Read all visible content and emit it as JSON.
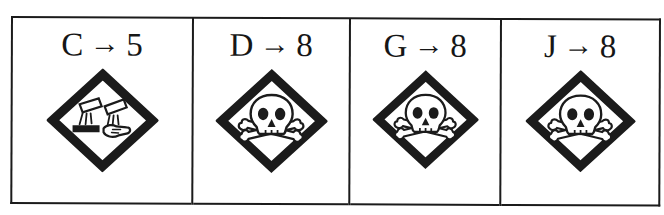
{
  "document": {
    "type": "scanned-answer-table",
    "background_color": "#ffffff",
    "ink_color": "#1b1b1b",
    "border_width_px": 2
  },
  "table": {
    "columns": 4,
    "rows": 1,
    "cells": [
      {
        "source_letter": "C",
        "arrow": "→",
        "target_number": "5",
        "mapping_text": "C → 5",
        "pictogram": "corrosion-hazard-icon",
        "pictogram_label": "GHS05 corrosion",
        "pictogram_description": "diamond outline containing two tilted test tubes pouring liquid onto a flat surface and a hand"
      },
      {
        "source_letter": "D",
        "arrow": "→",
        "target_number": "8",
        "mapping_text": "D → 8",
        "pictogram": "skull-and-crossbones-icon",
        "pictogram_label": "GHS06 acute toxicity",
        "pictogram_description": "diamond outline containing a skull above crossed bones"
      },
      {
        "source_letter": "G",
        "arrow": "→",
        "target_number": "8",
        "mapping_text": "G → 8",
        "pictogram": "skull-and-crossbones-icon",
        "pictogram_label": "GHS06 acute toxicity",
        "pictogram_description": "diamond outline containing a skull above crossed bones"
      },
      {
        "source_letter": "J",
        "arrow": "→",
        "target_number": "8",
        "mapping_text": "J → 8",
        "pictogram": "skull-and-crossbones-icon",
        "pictogram_label": "GHS06 acute toxicity",
        "pictogram_description": "diamond outline containing a skull above crossed bones"
      }
    ]
  }
}
